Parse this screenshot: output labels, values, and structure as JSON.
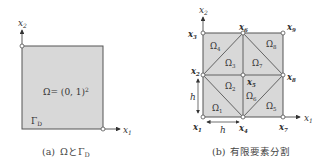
{
  "colors": {
    "region_fill": "#d8d8d8",
    "edge": "#555555",
    "node_fill": "#ffffff",
    "text": "#333333"
  },
  "panel_a": {
    "axis_x_label": "x",
    "axis_x_sub": "1",
    "axis_y_label": "x",
    "axis_y_sub": "2",
    "domain_label": "Ω= (0, 1)",
    "domain_exp": "2",
    "boundary_label": "Γ",
    "boundary_sub": "D",
    "caption_prefix": "(a)",
    "caption_text": "ΩとΓ",
    "caption_sub": "D"
  },
  "panel_b": {
    "axis_x_label": "x",
    "axis_x_sub": "1",
    "axis_y_label": "x",
    "axis_y_sub": "2",
    "nodes": [
      {
        "label": "x",
        "sub": "1"
      },
      {
        "label": "x",
        "sub": "2"
      },
      {
        "label": "x",
        "sub": "3"
      },
      {
        "label": "x",
        "sub": "4"
      },
      {
        "label": "x",
        "sub": "5"
      },
      {
        "label": "x",
        "sub": "6"
      },
      {
        "label": "x",
        "sub": "7"
      },
      {
        "label": "x",
        "sub": "8"
      },
      {
        "label": "x",
        "sub": "9"
      }
    ],
    "elements": [
      {
        "label": "Ω",
        "sub": "1"
      },
      {
        "label": "Ω",
        "sub": "2"
      },
      {
        "label": "Ω",
        "sub": "3"
      },
      {
        "label": "Ω",
        "sub": "4"
      },
      {
        "label": "Ω",
        "sub": "5"
      },
      {
        "label": "Ω",
        "sub": "6"
      },
      {
        "label": "Ω",
        "sub": "7"
      },
      {
        "label": "Ω",
        "sub": "8"
      }
    ],
    "h_vertical": "h",
    "h_horizontal": "h",
    "caption_prefix": "(b)",
    "caption_text": "有限要素分割"
  }
}
